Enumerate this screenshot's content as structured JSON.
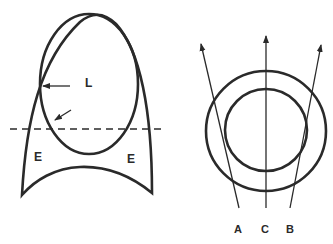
{
  "diagram": {
    "left_figure": {
      "labels": {
        "lumen": "L",
        "left_region": "E",
        "right_region": "E"
      }
    },
    "right_figure": {
      "labels": {
        "ray_a": "A",
        "ray_c": "C",
        "ray_b": "B"
      }
    },
    "colors": {
      "stroke": "#2a2a2a",
      "background": "#ffffff"
    }
  }
}
